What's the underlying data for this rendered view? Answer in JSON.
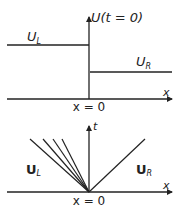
{
  "top_diagram": {
    "title_label": "U(t = 0)",
    "left_state_label": "U",
    "left_state_sub": "L",
    "right_state_label": "U",
    "right_state_sub": "R",
    "x_axis_label": "x",
    "origin_label": "x = 0"
  },
  "bottom_diagram": {
    "t_axis_label": "t",
    "left_state_label": "U",
    "left_state_sub": "L",
    "right_state_label": "U",
    "right_state_sub": "R",
    "x_axis_label": "x",
    "origin_label": "x = 0",
    "fan_lines": 4,
    "shock_lines": 1
  },
  "colors": {
    "stroke": "#222222",
    "background": "#ffffff"
  }
}
